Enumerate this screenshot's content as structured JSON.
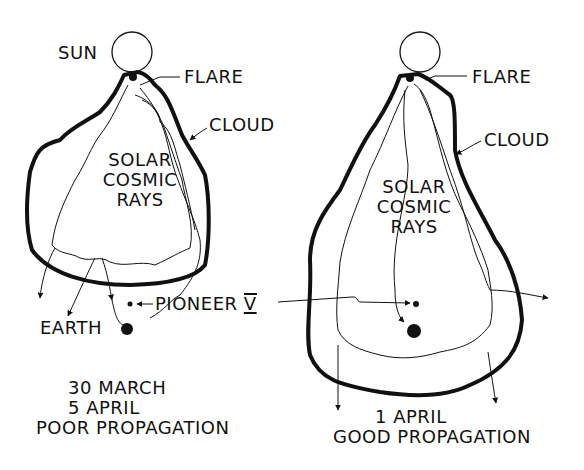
{
  "left_panel": {
    "sun_label": "SUN",
    "flare_label": "FLARE",
    "cloud_label": "CLOUD",
    "rays_label": [
      "SOLAR",
      "COSMIC",
      "RAYS"
    ],
    "earth_label": "EARTH",
    "pioneer_label": "PIONEER",
    "pioneer_numeral": "V",
    "caption": [
      "30 MARCH",
      "5 APRIL",
      "POOR PROPAGATION"
    ]
  },
  "right_panel": {
    "flare_label": "FLARE",
    "cloud_label": "CLOUD",
    "rays_label": [
      "SOLAR",
      "COSMIC",
      "RAYS"
    ],
    "caption": [
      "1 APRIL",
      "GOOD PROPAGATION"
    ]
  },
  "colors": {
    "ink": "#111111",
    "background": "#ffffff"
  }
}
